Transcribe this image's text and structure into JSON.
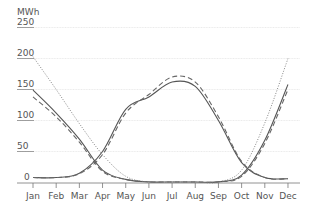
{
  "chart_data": {
    "type": "line",
    "title": "",
    "xlabel": "",
    "ylabel": "MWh",
    "ylim": [
      0,
      250
    ],
    "yticks": [
      0,
      50,
      100,
      150,
      200,
      250
    ],
    "grid": true,
    "legend": null,
    "categories": [
      "Jan",
      "Feb",
      "Mar",
      "Apr",
      "May",
      "Jun",
      "Jul",
      "Aug",
      "Sep",
      "Oct",
      "Nov",
      "Dec"
    ],
    "series": [
      {
        "name": "summer-solid",
        "style": "solid",
        "values": [
          8,
          8,
          15,
          50,
          118,
          138,
          162,
          155,
          100,
          32,
          8,
          6
        ]
      },
      {
        "name": "summer-dashed",
        "style": "dashed",
        "values": [
          8,
          8,
          14,
          45,
          112,
          142,
          170,
          162,
          106,
          34,
          8,
          6
        ]
      },
      {
        "name": "winter-solid",
        "style": "solid",
        "values": [
          149,
          112,
          70,
          20,
          5,
          1,
          0,
          0,
          1,
          12,
          68,
          158
        ]
      },
      {
        "name": "winter-dashed",
        "style": "dashed",
        "values": [
          138,
          106,
          65,
          18,
          5,
          1,
          0,
          0,
          1,
          10,
          63,
          150
        ]
      },
      {
        "name": "winter-dotted",
        "style": "dotted",
        "values": [
          203,
          150,
          95,
          45,
          10,
          0,
          0,
          0,
          0,
          20,
          96,
          200
        ]
      }
    ]
  },
  "colors": {
    "grid": "#e6e6e6",
    "axis": "#777777",
    "line": "#555555",
    "text": "#555555"
  }
}
